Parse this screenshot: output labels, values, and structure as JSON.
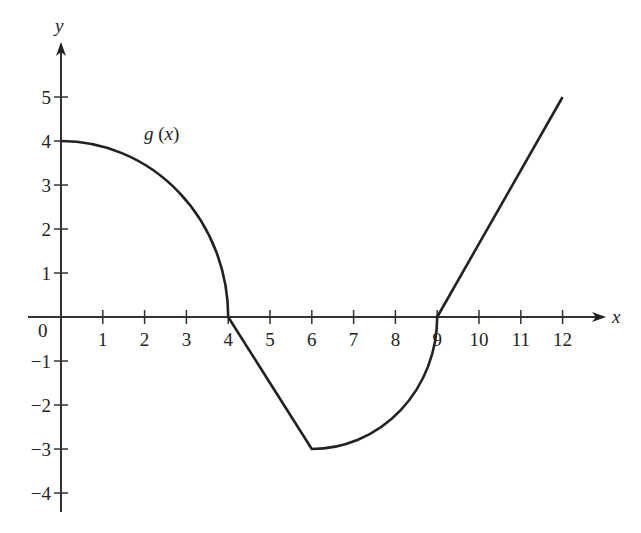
{
  "chart_data": {
    "type": "line",
    "title": "",
    "xlabel": "x",
    "ylabel": "y",
    "origin_label": "0",
    "xlim": [
      0,
      12
    ],
    "ylim": [
      -4,
      5
    ],
    "grid": false,
    "x_ticks": [
      "1",
      "2",
      "3",
      "4",
      "5",
      "6",
      "7",
      "8",
      "9",
      "10",
      "11",
      "12"
    ],
    "y_ticks": [
      "5",
      "4",
      "3",
      "2",
      "1",
      "−1",
      "−2",
      "−3",
      "−4"
    ],
    "series": [
      {
        "name": "g (x)",
        "segments": [
          {
            "kind": "quarter-ellipse",
            "from": [
              0,
              4
            ],
            "to": [
              4,
              0
            ],
            "description": "concave down, horizontal tangent at x=0, vertical tangent at x=4"
          },
          {
            "kind": "line",
            "from": [
              4,
              0
            ],
            "to": [
              6,
              -3
            ]
          },
          {
            "kind": "quarter-ellipse",
            "from": [
              6,
              -3
            ],
            "to": [
              9,
              0
            ],
            "description": "concave up, horizontal tangent at x=6, vertical tangent at x=9"
          },
          {
            "kind": "line",
            "from": [
              9,
              0
            ],
            "to": [
              12,
              5
            ]
          }
        ],
        "points": [
          [
            0,
            4
          ],
          [
            1,
            3.87
          ],
          [
            2,
            3.46
          ],
          [
            3,
            2.65
          ],
          [
            4,
            0
          ],
          [
            5,
            -1.5
          ],
          [
            6,
            -3
          ],
          [
            7,
            -2.83
          ],
          [
            8,
            -2.24
          ],
          [
            9,
            0
          ],
          [
            10,
            1.67
          ],
          [
            11,
            3.33
          ],
          [
            12,
            5
          ]
        ]
      }
    ],
    "annotations": [
      {
        "text": "g (x)",
        "x": 2.2,
        "y": 4.2
      }
    ]
  },
  "colors": {
    "curve": "#222222",
    "axis": "#333333",
    "background": "#ffffff"
  }
}
